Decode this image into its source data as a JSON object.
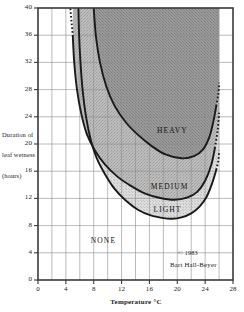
{
  "chart_data": {
    "type": "area",
    "title": "",
    "subtitle": "",
    "xlabel": "Temperature °C",
    "ylabel": "Duration of leaf wetness (hours)",
    "ylabel_lines": [
      "Duration of",
      "leaf wetness",
      "(hours)"
    ],
    "xlim": [
      0,
      28
    ],
    "ylim": [
      0,
      40
    ],
    "xticks": [
      0,
      4,
      8,
      12,
      16,
      20,
      24,
      28
    ],
    "xtick_labels": [
      "0",
      "4",
      "8",
      "12",
      "16",
      "20",
      "24",
      "28"
    ],
    "yticks": [
      0,
      4,
      8,
      12,
      16,
      20,
      24,
      28,
      32,
      36,
      40
    ],
    "ytick_labels": [
      "0",
      "4",
      "8",
      "12",
      "16",
      "20",
      "24",
      "28",
      "32",
      "36",
      "40"
    ],
    "x_minor_step": 2,
    "y_minor_step": 4,
    "grid": true,
    "grid_color": "#8d8d8d",
    "legend": "none",
    "frame_color": "#3a3a3a",
    "zones": [
      {
        "name": "NONE",
        "label": "NONE",
        "fill": "#ffffff",
        "label_x": 9.4,
        "label_y": 5.6,
        "description": "No infection"
      },
      {
        "name": "LIGHT",
        "label": "LIGHT",
        "fill": "#d2d2d2",
        "label_x": 18.6,
        "label_y": 10.2,
        "curve_min_hours": 9,
        "curve_min_temp": 19.2,
        "description": "Light infection"
      },
      {
        "name": "MEDIUM",
        "label": "MEDIUM",
        "fill": "#b2b2b2",
        "label_x": 18.9,
        "label_y": 13.6,
        "curve_min_hours": 11.8,
        "curve_min_temp": 19.6,
        "description": "Medium infection"
      },
      {
        "name": "HEAVY",
        "label": "HEAVY",
        "fill": "#8f8f8f",
        "label_x": 19.3,
        "label_y": 21.7,
        "curve_min_hours": 17.9,
        "curve_min_temp": 20.6,
        "description": "Heavy infection"
      }
    ],
    "series": [
      {
        "name": "LIGHT threshold",
        "line_color": "#1a1a1a",
        "solid_points": [
          [
            5.8,
            40.0
          ],
          [
            5.9,
            36.0
          ],
          [
            6.1,
            32.0
          ],
          [
            6.4,
            28.0
          ],
          [
            6.9,
            24.0
          ],
          [
            7.6,
            20.5
          ],
          [
            8.4,
            18.0
          ],
          [
            9.6,
            15.6
          ],
          [
            11.0,
            13.4
          ],
          [
            12.6,
            11.7
          ],
          [
            14.4,
            10.3
          ],
          [
            16.2,
            9.5
          ],
          [
            18.0,
            9.1
          ],
          [
            19.2,
            9.0
          ],
          [
            20.6,
            9.2
          ],
          [
            22.0,
            9.8
          ],
          [
            23.2,
            10.8
          ],
          [
            24.2,
            12.2
          ],
          [
            25.0,
            14.2
          ],
          [
            25.6,
            16.2
          ]
        ],
        "dotted_points": [
          [
            25.6,
            16.2
          ],
          [
            25.9,
            17.6
          ],
          [
            26.0,
            19.0
          ]
        ]
      },
      {
        "name": "MEDIUM threshold",
        "line_color": "#1a1a1a",
        "solid_points": [
          [
            5.0,
            35.8
          ],
          [
            5.2,
            32.0
          ],
          [
            5.6,
            28.0
          ],
          [
            6.2,
            24.5
          ],
          [
            7.0,
            21.5
          ],
          [
            8.2,
            19.0
          ],
          [
            9.6,
            17.0
          ],
          [
            11.4,
            15.2
          ],
          [
            13.4,
            13.8
          ],
          [
            15.4,
            12.7
          ],
          [
            17.4,
            12.1
          ],
          [
            19.6,
            11.8
          ],
          [
            21.4,
            12.1
          ],
          [
            22.9,
            13.0
          ],
          [
            24.0,
            14.6
          ],
          [
            24.9,
            17.0
          ],
          [
            25.4,
            19.4
          ]
        ],
        "dotted_points": [
          [
            25.4,
            19.4
          ],
          [
            25.8,
            22.0
          ],
          [
            26.0,
            24.6
          ]
        ]
      },
      {
        "name": "HEAVY threshold",
        "line_color": "#1a1a1a",
        "solid_points": [
          [
            8.0,
            40.0
          ],
          [
            8.3,
            36.0
          ],
          [
            8.9,
            32.0
          ],
          [
            9.8,
            28.5
          ],
          [
            11.0,
            25.6
          ],
          [
            12.6,
            23.2
          ],
          [
            14.4,
            21.3
          ],
          [
            16.2,
            19.8
          ],
          [
            18.2,
            18.5
          ],
          [
            20.6,
            17.9
          ],
          [
            22.4,
            18.2
          ],
          [
            23.7,
            19.2
          ],
          [
            24.6,
            21.0
          ],
          [
            25.2,
            23.4
          ],
          [
            25.6,
            25.6
          ]
        ],
        "dotted_points": [
          [
            25.6,
            25.6
          ],
          [
            25.9,
            27.4
          ],
          [
            26.0,
            29.0
          ]
        ]
      }
    ],
    "shade_right_edge_temp": 26.0,
    "annotations": [
      {
        "name": "copyright-year",
        "text": "© 1983",
        "x": 21.3,
        "y": 4.4
      },
      {
        "name": "copyright-author",
        "text": "Bart Hall-Beyer",
        "x": 22.6,
        "y": 3.0
      }
    ]
  },
  "credit": {
    "year": "© 1983",
    "author": "Bart Hall-Beyer"
  },
  "axes": {
    "x_title": "Temperature °C",
    "y_title_line1": "Duration of",
    "y_title_line2": "leaf wetness",
    "y_title_line3": "(hours)"
  },
  "zone_labels": {
    "none": "NONE",
    "light": "LIGHT",
    "medium": "MEDIUM",
    "heavy": "HEAVY"
  },
  "ticks": {
    "x": [
      "0",
      "4",
      "8",
      "12",
      "16",
      "20",
      "24",
      "28"
    ],
    "y": [
      "0",
      "4",
      "8",
      "12",
      "16",
      "20",
      "24",
      "28",
      "32",
      "36",
      "40"
    ]
  }
}
